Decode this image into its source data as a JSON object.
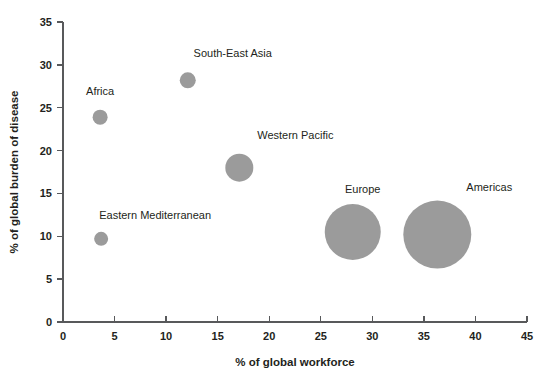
{
  "chart_data": {
    "type": "scatter",
    "title": "",
    "subtitle": "",
    "xlabel": "% of global workforce",
    "ylabel": "% of global burden of disease",
    "xlim": [
      0,
      45
    ],
    "ylim": [
      0,
      35
    ],
    "xticks": [
      "0",
      "5",
      "10",
      "15",
      "20",
      "25",
      "30",
      "35",
      "40",
      "45"
    ],
    "yticks": [
      "0",
      "5",
      "10",
      "15",
      "20",
      "25",
      "30",
      "35"
    ],
    "xtick_values": [
      0,
      5,
      10,
      15,
      20,
      25,
      30,
      35,
      40,
      45
    ],
    "ytick_values": [
      0,
      5,
      10,
      15,
      20,
      25,
      30,
      35
    ],
    "grid": false,
    "legend": "none",
    "bubble_color": "#9b9b9b",
    "axis_color": "#58595b",
    "text_color": "#231f20",
    "background": "#ffffff",
    "points": [
      {
        "name": "Africa",
        "x": 3.6,
        "y": 23.9,
        "r_px": 7.5,
        "label": "Africa",
        "label_dx": 0,
        "label_dy": -22
      },
      {
        "name": "Eastern Mediterranean",
        "x": 3.7,
        "y": 9.7,
        "r_px": 7.0,
        "label": "Eastern Mediterranean",
        "label_dx": 54,
        "label_dy": -20
      },
      {
        "name": "South-East Asia",
        "x": 12.1,
        "y": 28.2,
        "r_px": 8.0,
        "label": "South-East Asia",
        "label_dx": 45,
        "label_dy": -23
      },
      {
        "name": "Western Pacific",
        "x": 17.1,
        "y": 18.0,
        "r_px": 14.0,
        "label": "Western Pacific",
        "label_dx": 56,
        "label_dy": -29
      },
      {
        "name": "Europe",
        "x": 28.1,
        "y": 10.5,
        "r_px": 28.0,
        "label": "Europe",
        "label_dx": 10,
        "label_dy": -39
      },
      {
        "name": "Americas",
        "x": 36.3,
        "y": 10.2,
        "r_px": 34.0,
        "label": "Americas",
        "label_dx": 52,
        "label_dy": -44
      }
    ]
  }
}
